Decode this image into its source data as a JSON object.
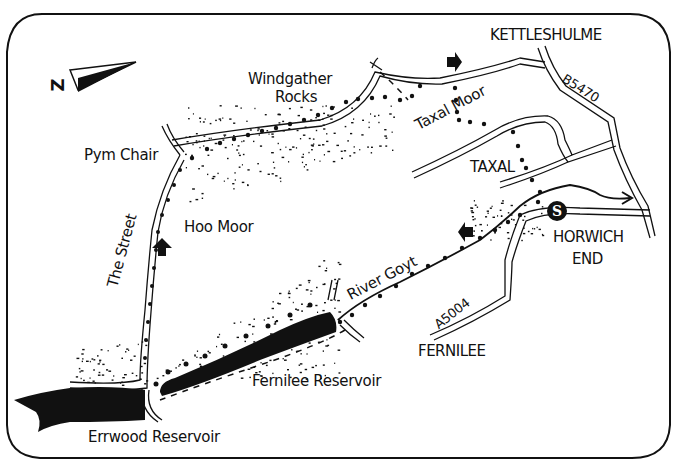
{
  "map": {
    "compass": {
      "letter": "N",
      "display": "Z"
    },
    "places": {
      "kettleshulme": "KETTLESHULME",
      "windgather": "Windgather",
      "rocks": "Rocks",
      "pym_chair": "Pym Chair",
      "taxal_moor": "Taxal Moor",
      "taxal": "TAXAL",
      "hoo_moor": "Hoo Moor",
      "the_street": "The Street",
      "river_goyt": "River Goyt",
      "horwich": "HORWICH",
      "end": "END",
      "fernilee": "FERNILEE",
      "fernilee_reservoir": "Fernilee Reservoir",
      "errwood_reservoir": "Errwood Reservoir"
    },
    "roads": {
      "b5470": "B5470",
      "a5004": "A5004"
    },
    "start_marker": "S",
    "colors": {
      "ink": "#111111",
      "paper": "#ffffff"
    }
  }
}
